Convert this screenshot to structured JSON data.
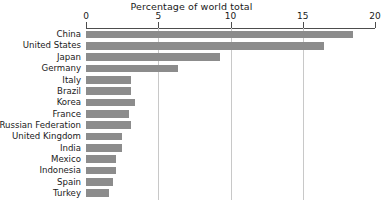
{
  "chart_data": {
    "type": "bar",
    "orientation": "horizontal",
    "title": "Percentage of world total",
    "xlabel": "",
    "ylabel": "",
    "xlim": [
      0,
      20
    ],
    "xticks": [
      0,
      5,
      10,
      15,
      20
    ],
    "xtick_labels": [
      "0",
      "5",
      "10",
      "15",
      "20"
    ],
    "grid": "vertical",
    "gridlines_at": [
      5,
      10,
      15
    ],
    "legend": "none",
    "bar_color": "#8c8c8c",
    "axis_color": "#4d4d4d",
    "gridline_color": "#c8c8c8",
    "categories": [
      "China",
      "United States",
      "Japan",
      "Germany",
      "Italy",
      "Brazil",
      "Korea",
      "France",
      "Russian Federation",
      "United Kingdom",
      "India",
      "Mexico",
      "Indonesia",
      "Spain",
      "Turkey"
    ],
    "values": [
      18.5,
      16.5,
      9.3,
      6.4,
      3.1,
      3.1,
      3.4,
      3.0,
      3.1,
      2.5,
      2.5,
      2.1,
      2.1,
      1.9,
      1.6
    ]
  }
}
